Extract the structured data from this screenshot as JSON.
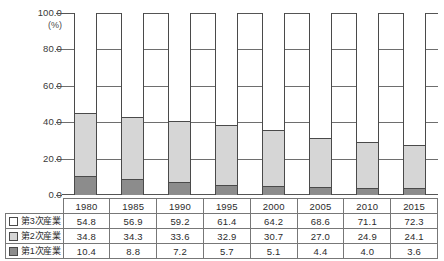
{
  "chart_data": {
    "type": "bar",
    "stacked": true,
    "title": "",
    "xlabel": "",
    "ylabel": "(%)",
    "unit_label": "(%)",
    "ylim": [
      0,
      100
    ],
    "yticks": [
      "0.0",
      "20.0",
      "40.0",
      "60.0",
      "80.0",
      "100.0"
    ],
    "ytick_values": [
      0,
      20,
      40,
      60,
      80,
      100
    ],
    "grid": true,
    "legend_position": "table-left",
    "categories": [
      "1980",
      "1985",
      "1990",
      "1995",
      "2000",
      "2005",
      "2010",
      "2015"
    ],
    "series": [
      {
        "name": "第3次産業",
        "color": "#ffffff",
        "values": [
          54.8,
          56.9,
          59.2,
          61.4,
          64.2,
          68.6,
          71.1,
          72.3
        ]
      },
      {
        "name": "第2次産業",
        "color": "#d6d6d6",
        "values": [
          34.8,
          34.3,
          33.6,
          32.9,
          30.7,
          27.0,
          24.9,
          24.1
        ]
      },
      {
        "name": "第1次産業",
        "color": "#8c8c8c",
        "values": [
          10.4,
          8.8,
          7.2,
          5.7,
          5.1,
          4.4,
          4.0,
          3.6
        ]
      }
    ]
  },
  "table": {
    "corner_label": "",
    "row_labels": [
      "第3次産業",
      "第2次産業",
      "第1次産業"
    ],
    "header": [
      "1980",
      "1985",
      "1990",
      "1995",
      "2000",
      "2005",
      "2010",
      "2015"
    ],
    "rows": [
      [
        "54.8",
        "56.9",
        "59.2",
        "61.4",
        "64.2",
        "68.6",
        "71.1",
        "72.3"
      ],
      [
        "34.8",
        "34.3",
        "33.6",
        "32.9",
        "30.7",
        "27.0",
        "24.9",
        "24.1"
      ],
      [
        "10.4",
        "8.8",
        "7.2",
        "5.7",
        "5.1",
        "4.4",
        "4.0",
        "3.6"
      ]
    ]
  },
  "colors": {
    "tertiary": "#ffffff",
    "secondary": "#d6d6d6",
    "primary": "#8c8c8c",
    "outline": "#4a4a4a",
    "grid": "#6e6e6e"
  }
}
